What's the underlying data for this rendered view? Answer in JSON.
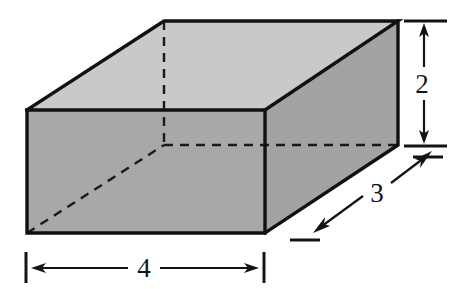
{
  "figure": {
    "name": "rectangular-prism-dimensions-diagram",
    "background_color": "#ffffff",
    "solid": {
      "shape": "rectangular prism",
      "faces": {
        "top": {
          "label": "top-face",
          "fill": "#c9c9c9"
        },
        "front": {
          "label": "front-face",
          "fill": "#a8a8a8"
        },
        "right": {
          "label": "right-face",
          "fill": "#a3a3a3"
        }
      },
      "edge_color": "#1a1a1a",
      "hidden_edge_style": "dashed",
      "vertices": {
        "front_top_left": [
          27,
          110
        ],
        "front_top_right": [
          265,
          110
        ],
        "front_bottom_left": [
          27,
          233
        ],
        "front_bottom_right": [
          265,
          233
        ],
        "back_top_left": [
          164,
          21
        ],
        "back_top_right": [
          398,
          21
        ],
        "back_bottom_right": [
          398,
          145
        ],
        "back_bottom_left_hidden": [
          164,
          145
        ]
      }
    },
    "dimensions": [
      {
        "name": "height-dimension",
        "value": "2",
        "axis": "vertical",
        "measures": "height",
        "position": "right of box",
        "arrow_style": "double-headed",
        "extension_ticks": 2
      },
      {
        "name": "depth-dimension",
        "value": "3",
        "axis": "diagonal",
        "measures": "depth",
        "position": "lower right of box",
        "arrow_style": "double-headed",
        "extension_ticks": 2
      },
      {
        "name": "width-dimension",
        "value": "4",
        "axis": "horizontal",
        "measures": "width",
        "position": "below box",
        "arrow_style": "double-headed",
        "extension_ticks": 2
      }
    ]
  }
}
